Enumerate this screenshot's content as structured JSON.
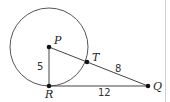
{
  "diagram": {
    "type": "geometry",
    "points": {
      "P": {
        "label": "P",
        "x": 49,
        "y": 47
      },
      "R": {
        "label": "R",
        "x": 49,
        "y": 86
      },
      "T": {
        "label": "T",
        "x": 87,
        "y": 62
      },
      "Q": {
        "label": "Q",
        "x": 148,
        "y": 86
      }
    },
    "circle": {
      "center": "P",
      "cx": 49,
      "cy": 47,
      "r": 39
    },
    "segments": [
      {
        "from": "P",
        "to": "R",
        "length_label": "5"
      },
      {
        "from": "T",
        "to": "Q",
        "length_label": "8"
      },
      {
        "from": "R",
        "to": "Q",
        "length_label": "12"
      },
      {
        "from": "P",
        "to": "T",
        "length_label": ""
      }
    ],
    "labels": {
      "P": "P",
      "R": "R",
      "T": "T",
      "Q": "Q",
      "PR": "5",
      "TQ": "8",
      "RQ": "12"
    },
    "colors": {
      "stroke": "#555555",
      "point": "#111111",
      "border": "#cccccc"
    }
  }
}
